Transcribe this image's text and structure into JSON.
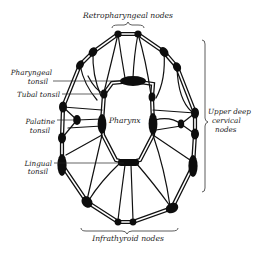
{
  "diagram": {
    "colors": {
      "ink": "#111111",
      "background": "#ffffff"
    },
    "labels": {
      "retropharyngeal": "Retropharyngeal nodes",
      "pharyngeal_tonsil_1": "Pharyngeal",
      "pharyngeal_tonsil_2": "tonsil",
      "tubal_tonsil": "Tubal tonsil",
      "palatine_tonsil_1": "Palatine",
      "palatine_tonsil_2": "tonsil",
      "lingual_tonsil_1": "Lingual",
      "lingual_tonsil_2": "tonsil",
      "pharynx": "Pharynx",
      "upper_deep_cervical_1": "Upper deep",
      "upper_deep_cervical_2": "cervical",
      "upper_deep_cervical_3": "nodes",
      "infrathyroid": "Infrathyroid nodes"
    },
    "node_groups": [
      {
        "name": "Retropharyngeal nodes",
        "count": 2
      },
      {
        "name": "Upper deep cervical nodes",
        "count": 12
      },
      {
        "name": "Infrathyroid nodes",
        "count": 2
      },
      {
        "name": "Pharyngeal tonsil",
        "count": 1
      },
      {
        "name": "Tubal tonsil",
        "count": 2
      },
      {
        "name": "Palatine tonsil",
        "count": 2
      },
      {
        "name": "Lingual tonsil",
        "count": 1
      }
    ]
  }
}
